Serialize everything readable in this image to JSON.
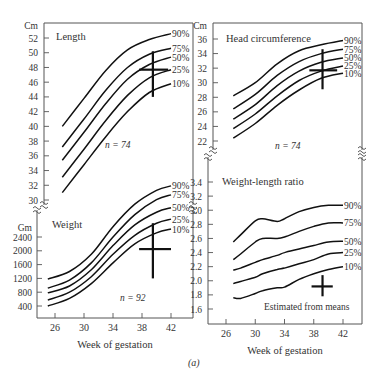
{
  "figure_label": "(a)",
  "chart_data": [
    {
      "type": "line",
      "title": "Length",
      "unit_label": "Cm",
      "xlabel": "",
      "ylabel": "Cm",
      "n_label": "n = 74",
      "yticks": [
        30,
        32,
        34,
        36,
        38,
        40,
        42,
        44,
        46,
        48,
        50,
        52
      ],
      "ylim": [
        30,
        53
      ],
      "x": [
        27,
        30,
        33,
        36,
        39,
        42
      ],
      "series": [
        {
          "name": "90%",
          "values": [
            40.0,
            43.8,
            47.6,
            50.4,
            51.8,
            52.6
          ]
        },
        {
          "name": "75%",
          "values": [
            37.2,
            41.0,
            44.9,
            48.0,
            49.8,
            50.6
          ]
        },
        {
          "name": "50%",
          "values": [
            35.4,
            39.2,
            43.1,
            46.4,
            48.4,
            49.4
          ]
        },
        {
          "name": "25%",
          "values": [
            33.1,
            36.9,
            40.8,
            44.2,
            46.6,
            47.7
          ]
        },
        {
          "name": "10%",
          "values": [
            31.0,
            34.8,
            38.6,
            42.0,
            44.6,
            45.8
          ]
        }
      ],
      "mean_marker": {
        "x": 39.5,
        "y": 47.7,
        "y_range": [
          44.0,
          50.2
        ],
        "x_range": [
          37.6,
          41.6
        ]
      }
    },
    {
      "type": "line",
      "title": "Head circumference",
      "unit_label": "Cm",
      "ylabel": "Cm",
      "n_label": "n = 74",
      "yticks": [
        22,
        24,
        26,
        28,
        30,
        32,
        34,
        36
      ],
      "ylim": [
        21.5,
        37
      ],
      "x": [
        27,
        30,
        33,
        36,
        39,
        42
      ],
      "series": [
        {
          "name": "90%",
          "values": [
            28.2,
            30.0,
            32.6,
            34.4,
            35.2,
            35.8
          ]
        },
        {
          "name": "75%",
          "values": [
            26.4,
            28.4,
            31.0,
            32.9,
            34.0,
            34.6
          ]
        },
        {
          "name": "50%",
          "values": [
            25.0,
            27.0,
            29.6,
            31.6,
            32.8,
            33.4
          ]
        },
        {
          "name": "25%",
          "values": [
            23.7,
            25.7,
            28.2,
            30.3,
            31.6,
            32.3
          ]
        },
        {
          "name": "10%",
          "values": [
            22.4,
            24.4,
            26.9,
            29.0,
            30.6,
            31.3
          ]
        }
      ],
      "mean_marker": {
        "x": 39.2,
        "y": 31.7,
        "y_range": [
          29.1,
          34.6
        ],
        "x_range": [
          37.4,
          41.2
        ]
      }
    },
    {
      "type": "line",
      "title": "Weight",
      "unit_label": "Gm",
      "xlabel": "Week of gestation",
      "ylabel": "Gm",
      "n_label": "n = 92",
      "xticks": [
        26,
        30,
        34,
        38,
        42
      ],
      "yticks": [
        400,
        800,
        1200,
        1600,
        2000,
        2400
      ],
      "ylim": [
        200,
        2600
      ],
      "x": [
        25,
        28,
        31,
        34,
        37,
        40,
        42
      ],
      "series": [
        {
          "name": "90%",
          "values": [
            1180,
            1400,
            1900,
            2700,
            3350,
            3750,
            3880
          ]
        },
        {
          "name": "75%",
          "values": [
            920,
            1150,
            1650,
            2400,
            3050,
            3480,
            3620
          ]
        },
        {
          "name": "50%",
          "values": [
            780,
            980,
            1450,
            2150,
            2750,
            3120,
            3250
          ]
        },
        {
          "name": "25%",
          "values": [
            570,
            800,
            1250,
            1900,
            2450,
            2800,
            2920
          ]
        },
        {
          "name": "10%",
          "values": [
            400,
            620,
            1050,
            1650,
            2200,
            2520,
            2630
          ]
        }
      ],
      "mean_marker": {
        "x": 39.5,
        "y": 2050,
        "y_range": [
          1200,
          2800
        ],
        "x_range": [
          37.6,
          42.0
        ]
      }
    },
    {
      "type": "line",
      "title": "Weight-length ratio",
      "xlabel": "Week of gestation",
      "ylabel": "",
      "annotation": "Estimated from means",
      "xticks": [
        26,
        30,
        34,
        38,
        42
      ],
      "yticks": [
        1.6,
        1.8,
        2.0,
        2.2,
        2.4,
        2.6,
        2.8,
        3.0,
        3.2,
        3.4
      ],
      "ylim": [
        1.45,
        3.5
      ],
      "x": [
        27,
        28,
        30,
        31,
        33,
        34,
        36,
        38,
        40,
        42
      ],
      "series": [
        {
          "name": "90%",
          "values": [
            2.55,
            2.65,
            2.85,
            2.88,
            2.84,
            2.88,
            2.98,
            3.04,
            3.07,
            3.07
          ]
        },
        {
          "name": "75%",
          "values": [
            2.3,
            2.38,
            2.55,
            2.6,
            2.6,
            2.62,
            2.7,
            2.77,
            2.82,
            2.82
          ]
        },
        {
          "name": "50%",
          "values": [
            2.15,
            2.18,
            2.26,
            2.3,
            2.36,
            2.4,
            2.45,
            2.5,
            2.55,
            2.56
          ]
        },
        {
          "name": "25%",
          "values": [
            1.96,
            1.99,
            2.05,
            2.1,
            2.16,
            2.18,
            2.24,
            2.3,
            2.38,
            2.4
          ]
        },
        {
          "name": "10%",
          "values": [
            1.76,
            1.75,
            1.82,
            1.86,
            1.9,
            1.91,
            2.02,
            2.1,
            2.16,
            2.2
          ]
        }
      ],
      "mean_marker": {
        "x": 39.2,
        "y": 1.92,
        "y_range": [
          1.78,
          2.08
        ],
        "x_range": [
          37.7,
          40.6
        ]
      }
    }
  ]
}
